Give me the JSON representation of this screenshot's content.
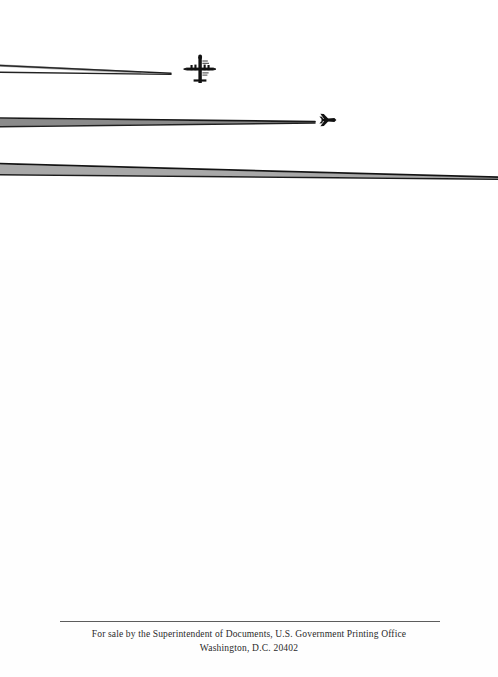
{
  "page": {
    "kind": "scanned-book-page",
    "background_color": "#fefefe",
    "width": 498,
    "height": 677
  },
  "photo": {
    "caption": "",
    "alt_name": "aircraft-contrails-photograph",
    "background_color": "#ffffff",
    "ink_color": "#1a1a1a",
    "aircraft": [
      {
        "name": "four-engine-bomber-aircraft",
        "label": "four-engine bomber",
        "x": 200,
        "y": 70
      },
      {
        "name": "jet-aircraft",
        "label": "jet aircraft",
        "x": 329,
        "y": 120
      }
    ],
    "contrails": [
      {
        "name": "contrail-upper-a",
        "x1": 0,
        "y1": 66,
        "x2": 171,
        "y2": 73
      },
      {
        "name": "contrail-upper-b",
        "x1": 0,
        "y1": 72,
        "x2": 171,
        "y2": 75
      },
      {
        "name": "contrail-middle-a",
        "x1": 0,
        "y1": 118,
        "x2": 315,
        "y2": 122
      },
      {
        "name": "contrail-middle-b",
        "x1": 0,
        "y1": 127,
        "x2": 315,
        "y2": 123
      },
      {
        "name": "contrail-lower-a",
        "x1": 0,
        "y1": 164,
        "x2": 498,
        "y2": 177
      },
      {
        "name": "contrail-lower-b",
        "x1": 0,
        "y1": 175,
        "x2": 498,
        "y2": 179
      }
    ]
  },
  "imprint": {
    "rule_color": "#5d5d5d",
    "text_color": "#2a2a2a",
    "line_1": "For sale by the Superintendent of Documents, U.S. Government Printing Office",
    "line_2": "Washington, D.C. 20402"
  }
}
